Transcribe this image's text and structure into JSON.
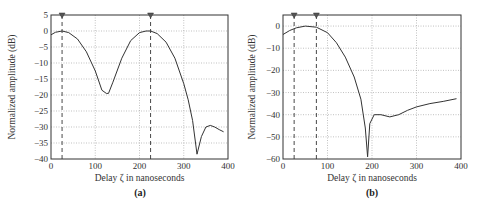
{
  "chart_data": [
    {
      "type": "line",
      "panel": "(a)",
      "caption": "(a)",
      "xlabel": "Delay ζ in nanoseconds",
      "ylabel": "Normalized amplitude (dB)",
      "xlim": [
        0,
        400
      ],
      "ylim": [
        -40,
        5
      ],
      "xticks": [
        0,
        100,
        200,
        300,
        400
      ],
      "yticks": [
        5,
        0,
        -5,
        -10,
        -15,
        -20,
        -25,
        -30,
        -35,
        -40
      ],
      "grid": true,
      "markers_x": [
        25,
        225
      ],
      "x": [
        0,
        10,
        25,
        40,
        60,
        80,
        100,
        115,
        125,
        130,
        140,
        160,
        180,
        200,
        215,
        225,
        240,
        260,
        280,
        300,
        310,
        320,
        330,
        340,
        350,
        360,
        370,
        380,
        390
      ],
      "values": [
        -1.2,
        -0.4,
        0,
        -0.5,
        -2.5,
        -6.5,
        -12.5,
        -18.5,
        -19.5,
        -19.5,
        -16,
        -8.5,
        -3,
        -0.5,
        0,
        0,
        -0.8,
        -3.5,
        -8.5,
        -16.5,
        -21.5,
        -28,
        -38.5,
        -33,
        -30,
        -29.5,
        -30,
        -30.8,
        -31.5
      ]
    },
    {
      "type": "line",
      "panel": "(b)",
      "caption": "(b)",
      "xlabel": "Delay ζ in nanoseconds",
      "ylabel": "Normalized amplitude (dB)",
      "xlim": [
        0,
        400
      ],
      "ylim": [
        -60,
        5
      ],
      "xticks": [
        0,
        100,
        200,
        300,
        400
      ],
      "yticks": [
        0,
        -10,
        -20,
        -30,
        -40,
        -50,
        -60
      ],
      "grid": true,
      "markers_x": [
        25,
        75
      ],
      "x": [
        0,
        15,
        30,
        50,
        75,
        100,
        120,
        140,
        160,
        175,
        185,
        190,
        195,
        205,
        220,
        240,
        260,
        280,
        300,
        330,
        360,
        390
      ],
      "values": [
        -3.8,
        -2,
        -0.8,
        0,
        -0.5,
        -3,
        -7.5,
        -14,
        -23,
        -33,
        -46,
        -59,
        -44,
        -40,
        -40,
        -41,
        -40,
        -38,
        -36.5,
        -35,
        -34,
        -32.8
      ]
    }
  ]
}
